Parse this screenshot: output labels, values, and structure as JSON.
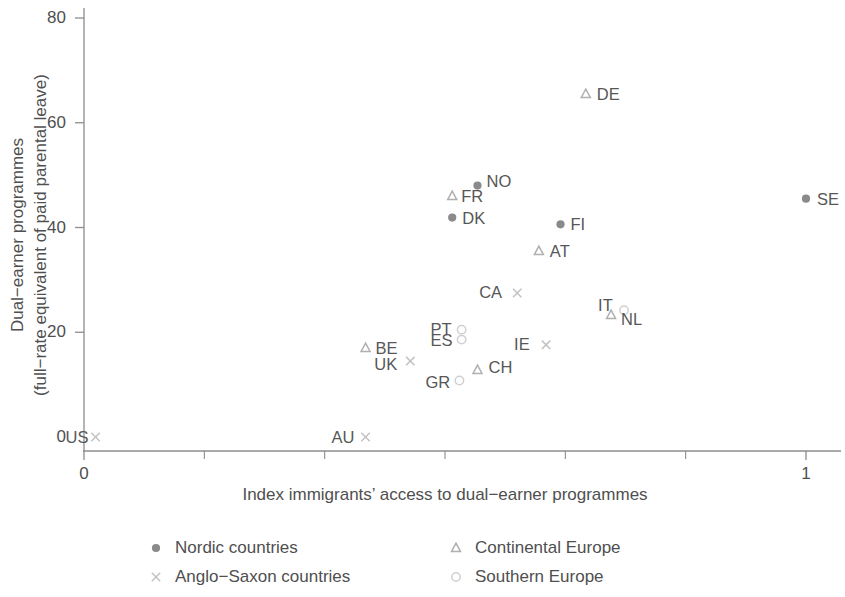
{
  "chart_data": {
    "type": "scatter",
    "title": "",
    "xlabel": "Index immigrants’ access to dual−earner programmes",
    "ylabel": "Dual−earner programmes\n(full−rate equivalent of paid parental leave)",
    "xlim": [
      0,
      1
    ],
    "ylim": [
      0,
      80
    ],
    "xticks": [
      0,
      1
    ],
    "xticklabels": [
      "0",
      "1"
    ],
    "xminorticks": [
      0.1667,
      0.3333,
      0.5,
      0.6667,
      0.8333
    ],
    "yticks": [
      0,
      20,
      40,
      60,
      80
    ],
    "yticklabels": [
      "0",
      "20",
      "40",
      "60",
      "80"
    ],
    "grid": false,
    "legend_position": "below-axes",
    "series": [
      {
        "name": "Nordic countries",
        "marker": "filled-circle",
        "color": "#8a8a8a",
        "points": [
          {
            "label": "NO",
            "x": 0.545,
            "y": 48.0,
            "label_dx": 9,
            "label_dy": -5
          },
          {
            "label": "DK",
            "x": 0.51,
            "y": 41.9,
            "label_dx": 10,
            "label_dy": 0
          },
          {
            "label": "FI",
            "x": 0.66,
            "y": 40.6,
            "label_dx": 10,
            "label_dy": 0
          },
          {
            "label": "SE",
            "x": 1.0,
            "y": 45.5,
            "label_dx": 11,
            "label_dy": 0
          }
        ]
      },
      {
        "name": "Continental Europe",
        "marker": "triangle",
        "color": "#b0b0b0",
        "points": [
          {
            "label": "DE",
            "x": 0.695,
            "y": 65.5,
            "label_dx": 11,
            "label_dy": 0
          },
          {
            "label": "FR",
            "x": 0.51,
            "y": 46.0,
            "label_dx": 9,
            "label_dy": 0
          },
          {
            "label": "AT",
            "x": 0.63,
            "y": 35.5,
            "label_dx": 11,
            "label_dy": 0
          },
          {
            "label": "NL",
            "x": 0.73,
            "y": 23.3,
            "label_dx": 10,
            "label_dy": 4
          },
          {
            "label": "BE",
            "x": 0.39,
            "y": 17.0,
            "label_dx": 10,
            "label_dy": 0
          },
          {
            "label": "CH",
            "x": 0.545,
            "y": 12.8,
            "label_dx": 11,
            "label_dy": -3
          }
        ]
      },
      {
        "name": "Anglo−Saxon countries",
        "marker": "cross",
        "color": "#c2c2c2",
        "points": [
          {
            "label": "US",
            "x": 0.016,
            "y": 0.0,
            "label_dx": -30,
            "label_dy": 0
          },
          {
            "label": "AU",
            "x": 0.39,
            "y": 0.0,
            "label_dx": -34,
            "label_dy": 0
          },
          {
            "label": "UK",
            "x": 0.452,
            "y": 14.5,
            "label_dx": -36,
            "label_dy": 3
          },
          {
            "label": "CA",
            "x": 0.6,
            "y": 27.5,
            "label_dx": -38,
            "label_dy": -1
          },
          {
            "label": "IE",
            "x": 0.64,
            "y": 17.6,
            "label_dx": -32,
            "label_dy": -1
          }
        ]
      },
      {
        "name": "Southern Europe",
        "marker": "open-circle",
        "color": "#d0d0d0",
        "points": [
          {
            "label": "IT",
            "x": 0.748,
            "y": 24.2,
            "label_dx": -26,
            "label_dy": -5
          },
          {
            "label": "PT",
            "x": 0.523,
            "y": 20.5,
            "label_dx": -31,
            "label_dy": -1
          },
          {
            "label": "ES",
            "x": 0.523,
            "y": 18.6,
            "label_dx": -31,
            "label_dy": 0
          },
          {
            "label": "GR",
            "x": 0.52,
            "y": 10.8,
            "label_dx": -34,
            "label_dy": 2
          }
        ]
      }
    ]
  },
  "legend": {
    "entries": [
      {
        "label": "Nordic countries",
        "marker": "filled-circle"
      },
      {
        "label": "Continental Europe",
        "marker": "triangle"
      },
      {
        "label": "Anglo−Saxon countries",
        "marker": "cross"
      },
      {
        "label": "Southern Europe",
        "marker": "open-circle"
      }
    ]
  }
}
